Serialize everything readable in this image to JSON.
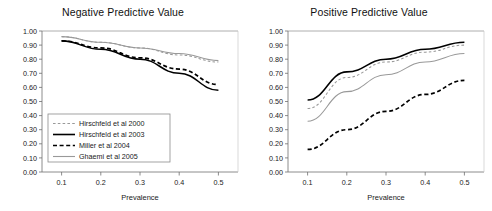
{
  "figure": {
    "panels": [
      "npv",
      "ppv"
    ]
  },
  "common": {
    "xlabel": "Prevalence",
    "ylabel": "",
    "x_ticks": [
      "0.1",
      "0.2",
      "0.3",
      "0.4",
      "0.5"
    ],
    "y_ticks": [
      "0.00",
      "0.10",
      "0.20",
      "0.30",
      "0.40",
      "0.50",
      "0.60",
      "0.70",
      "0.80",
      "0.90",
      "1.00"
    ],
    "series_colors": {
      "hirschfeld2000": "#999999",
      "hirschfeld2003": "#000000",
      "miller2004": "#000000",
      "ghaemi2005": "#999999"
    }
  },
  "legend": {
    "items": [
      {
        "label": "Hirschfeld et al 2000",
        "style": "dashed",
        "color": "#999999",
        "width": 1.1
      },
      {
        "label": "Hirschfeld et al 2003",
        "style": "solid",
        "color": "#000000",
        "width": 1.6
      },
      {
        "label": "Miller et al 2004",
        "style": "dashed",
        "color": "#000000",
        "width": 1.7
      },
      {
        "label": "Ghaemi et al 2005",
        "style": "solid",
        "color": "#999999",
        "width": 1.1
      }
    ]
  },
  "chart_data": [
    {
      "id": "npv",
      "type": "line",
      "title": "Negative Predictive Value",
      "xlabel": "Prevalence",
      "ylabel": "",
      "xlim": [
        0.05,
        0.55
      ],
      "ylim": [
        0.0,
        1.0
      ],
      "grid": false,
      "legend_position": "inside-lower-left",
      "x": [
        0.1,
        0.2,
        0.3,
        0.4,
        0.5
      ],
      "series": [
        {
          "name": "Hirschfeld et al 2000",
          "style": "dashed",
          "color": "#999999",
          "values": [
            0.96,
            0.92,
            0.88,
            0.83,
            0.78
          ]
        },
        {
          "name": "Hirschfeld et al 2003",
          "style": "solid",
          "color": "#000000",
          "values": [
            0.93,
            0.87,
            0.8,
            0.7,
            0.58
          ]
        },
        {
          "name": "Miller et al 2004",
          "style": "dashed",
          "color": "#000000",
          "values": [
            0.93,
            0.88,
            0.81,
            0.73,
            0.62
          ]
        },
        {
          "name": "Ghaemi et al 2005",
          "style": "solid",
          "color": "#999999",
          "values": [
            0.96,
            0.92,
            0.88,
            0.84,
            0.79
          ]
        }
      ]
    },
    {
      "id": "ppv",
      "type": "line",
      "title": "Positive Predictive Value",
      "xlabel": "Prevalence",
      "ylabel": "",
      "xlim": [
        0.05,
        0.55
      ],
      "ylim": [
        0.0,
        1.0
      ],
      "grid": false,
      "legend_position": "none",
      "x": [
        0.1,
        0.2,
        0.3,
        0.4,
        0.5
      ],
      "series": [
        {
          "name": "Hirschfeld et al 2003",
          "style": "solid",
          "color": "#000000",
          "values": [
            0.51,
            0.71,
            0.8,
            0.87,
            0.92
          ]
        },
        {
          "name": "Hirschfeld et al 2000",
          "style": "dashed",
          "color": "#999999",
          "values": [
            0.45,
            0.67,
            0.78,
            0.85,
            0.9
          ]
        },
        {
          "name": "Ghaemi et al 2005",
          "style": "solid",
          "color": "#999999",
          "values": [
            0.36,
            0.57,
            0.69,
            0.78,
            0.84
          ]
        },
        {
          "name": "Miller et al 2004",
          "style": "dashed",
          "color": "#000000",
          "values": [
            0.16,
            0.3,
            0.43,
            0.55,
            0.65
          ]
        }
      ]
    }
  ]
}
